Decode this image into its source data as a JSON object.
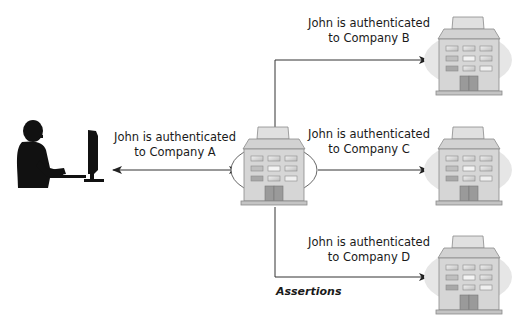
{
  "diagram": {
    "type": "identity-federation-flow",
    "user": {
      "name": "John",
      "icon": "user-at-computer-icon"
    },
    "identity_provider": {
      "label": "Company A",
      "icon": "building-icon"
    },
    "link_a": {
      "line1": "John is authenticated",
      "line2": "to Company A"
    },
    "service_providers": [
      {
        "label": "Company B",
        "line1": "John is authenticated",
        "line2": "to Company B"
      },
      {
        "label": "Company C",
        "line1": "John is authenticated",
        "line2": "to Company C"
      },
      {
        "label": "Company D",
        "line1": "John is authenticated",
        "line2": "to Company D"
      }
    ],
    "assertions_label": "Assertions",
    "colors": {
      "line": "#333333",
      "silhouette": "#111111",
      "building_body": "#d6d6d6",
      "building_roof": "#e4e4e4",
      "building_outline": "#8a8a8a",
      "window": "#c9c9c9",
      "door": "#9a9a9a",
      "ellipse_fill_center": "#ffffff",
      "ellipse_fill_target": "#e6e6e6"
    }
  }
}
